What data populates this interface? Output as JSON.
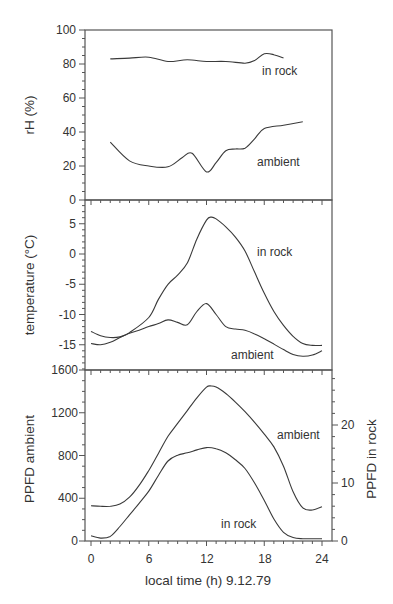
{
  "chart_data": [
    {
      "type": "line",
      "panel": "top",
      "ylabel": "rH (%)",
      "ylim": [
        0,
        100
      ],
      "yticks": [
        0,
        20,
        40,
        60,
        80,
        100
      ],
      "xlim": [
        0,
        24
      ],
      "grid": false,
      "series": [
        {
          "name": "in rock",
          "x": [
            2,
            4,
            6,
            8,
            10,
            12,
            14,
            16,
            17,
            18,
            19,
            20
          ],
          "values": [
            83,
            83.5,
            84,
            81.5,
            82.5,
            81.5,
            81.5,
            80.5,
            82,
            86,
            85.5,
            83.5
          ]
        },
        {
          "name": "ambient",
          "x": [
            2,
            4,
            6,
            8,
            9.5,
            10.5,
            12,
            13,
            14,
            15,
            16,
            17,
            18,
            20,
            22
          ],
          "values": [
            34,
            23,
            20,
            19.5,
            25,
            27.5,
            16.5,
            22,
            29,
            30,
            30.5,
            36,
            42,
            44,
            46
          ]
        }
      ],
      "annotations": [
        "in rock",
        "ambient"
      ]
    },
    {
      "type": "line",
      "panel": "middle",
      "ylabel": "temperature (°C)",
      "ylim": [
        -19,
        8
      ],
      "yticks": [
        -15,
        -10,
        -5,
        0,
        5
      ],
      "xlim": [
        0,
        24
      ],
      "grid": false,
      "series": [
        {
          "name": "in rock",
          "x": [
            0,
            1,
            2,
            3,
            4,
            6,
            7,
            8,
            9,
            10,
            11,
            12,
            12.5,
            13,
            14,
            15,
            16,
            17,
            18,
            19,
            20,
            21,
            22,
            23,
            24
          ],
          "values": [
            -14.8,
            -15,
            -14.6,
            -13.8,
            -13,
            -10.5,
            -7.5,
            -5,
            -3.5,
            -1.5,
            2.5,
            5.6,
            6.1,
            5.8,
            4.5,
            2.8,
            0.5,
            -3,
            -6.5,
            -9.5,
            -11.8,
            -13.6,
            -14.8,
            -15.1,
            -15.1
          ]
        },
        {
          "name": "ambient",
          "x": [
            0,
            1,
            2,
            3,
            4,
            5,
            6,
            7,
            8,
            9,
            10,
            11,
            12,
            13,
            14,
            15,
            16,
            17,
            18,
            19,
            20,
            21,
            22,
            23,
            24
          ],
          "values": [
            -12.8,
            -13.5,
            -13.8,
            -13.7,
            -13.1,
            -12.6,
            -12,
            -11.5,
            -10.9,
            -11.3,
            -11.7,
            -9.5,
            -8.2,
            -10,
            -12,
            -12.4,
            -12.6,
            -13.2,
            -14,
            -14.9,
            -15.8,
            -16.6,
            -16.9,
            -16.7,
            -16
          ]
        }
      ],
      "annotations": [
        "in rock",
        "ambient"
      ]
    },
    {
      "type": "line",
      "panel": "bottom",
      "ylabel": "PPFD  ambient",
      "y2label": "PPFD  in  rock",
      "ylim": [
        0,
        1600
      ],
      "yticks": [
        0,
        400,
        800,
        1200,
        1600
      ],
      "y2lim": [
        0,
        27.6
      ],
      "y2ticks": [
        0,
        10,
        20
      ],
      "xlabel": "local time (h) 9.12.79",
      "xticks": [
        0,
        6,
        12,
        18,
        24
      ],
      "xlim": [
        0,
        24
      ],
      "grid": false,
      "series": [
        {
          "name": "ambient",
          "axis": "left",
          "x": [
            0,
            1,
            2,
            3,
            4,
            5,
            6,
            7,
            8,
            9,
            10,
            11,
            12,
            12.5,
            13,
            14,
            15,
            16,
            17,
            18,
            19,
            20,
            21,
            22,
            23,
            24
          ],
          "values": [
            330,
            325,
            325,
            345,
            410,
            520,
            660,
            820,
            980,
            1100,
            1220,
            1340,
            1440,
            1450,
            1440,
            1380,
            1300,
            1210,
            1110,
            1000,
            880,
            700,
            460,
            310,
            290,
            320
          ]
        },
        {
          "name": "in rock",
          "axis": "right",
          "x": [
            0,
            1,
            2,
            3,
            4,
            5,
            6,
            7,
            8,
            9,
            10,
            11,
            12,
            13,
            14,
            15,
            16,
            17,
            18,
            19,
            20,
            21,
            22,
            23,
            24
          ],
          "values": [
            0.9,
            0.5,
            0.8,
            2.5,
            4.5,
            6.5,
            8.6,
            11.3,
            13.8,
            14.8,
            15.2,
            15.7,
            16.1,
            15.9,
            15.2,
            14,
            12.5,
            10,
            7,
            3.8,
            1.5,
            0.6,
            0.4,
            0.4,
            0.4
          ]
        }
      ],
      "annotations": [
        "ambient",
        "in rock"
      ]
    }
  ],
  "labels": {
    "top": {
      "ylabel": "rH (%)",
      "yticks": [
        "100",
        "80",
        "60",
        "40",
        "20",
        "0"
      ],
      "anno_rock": "in  rock",
      "anno_ambient": "ambient"
    },
    "middle": {
      "ylabel": "temperature (°C)",
      "yticks": [
        "5",
        "0",
        "-5",
        "-10",
        "-15"
      ],
      "anno_rock": "in  rock",
      "anno_ambient": "ambient"
    },
    "bottom": {
      "ylabel": "PPFD  ambient",
      "y2label": "PPFD  in  rock",
      "yticks": [
        "1600",
        "1200",
        "800",
        "400",
        "0"
      ],
      "y2ticks": [
        "20",
        "10",
        "0"
      ],
      "xticks": [
        "0",
        "6",
        "12",
        "18",
        "24"
      ],
      "xlabel": "local time (h) 9.12.79",
      "anno_ambient": "ambient",
      "anno_rock": "in  rock"
    }
  }
}
